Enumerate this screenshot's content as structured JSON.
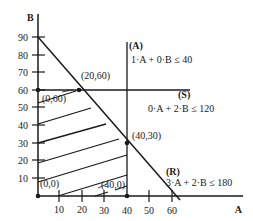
{
  "axes": {
    "x_label": "A",
    "y_label": "B",
    "x_ticks": [
      "10",
      "20",
      "30",
      "40",
      "50",
      "60"
    ],
    "y_ticks": [
      "90",
      "80",
      "70",
      "60",
      "50",
      "40",
      "30",
      "20",
      "10"
    ]
  },
  "constraints": [
    {
      "id": "(A)",
      "expr": "1·A + 0·B ≤ 40"
    },
    {
      "id": "(S)",
      "expr": "0·A + 2·B ≤ 120"
    },
    {
      "id": "(R)",
      "expr": "3·A + 2·B ≤ 180"
    }
  ],
  "vertices": [
    {
      "label": "(0,0)"
    },
    {
      "label": "(0,60)"
    },
    {
      "label": "(20,60)"
    },
    {
      "label": "(40,30)"
    },
    {
      "label": "(40,0)"
    }
  ],
  "colors": {
    "ink": "#1a1a1a",
    "background": "#ffffff"
  }
}
